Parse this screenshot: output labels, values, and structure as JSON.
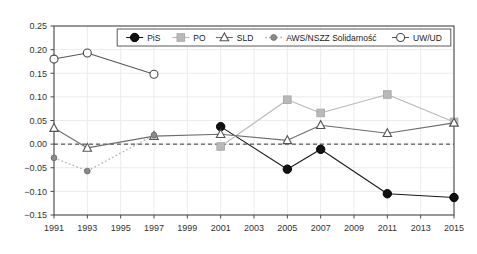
{
  "chart_data": {
    "type": "line",
    "title": "",
    "subtitle": "",
    "xlabel": "",
    "ylabel": "",
    "x": [
      1991,
      1993,
      1995,
      1997,
      1999,
      2001,
      2003,
      2005,
      2007,
      2009,
      2011,
      2013,
      2015
    ],
    "xtick_labels": [
      "1991",
      "1993",
      "1995",
      "1997",
      "1999",
      "2001",
      "2003",
      "2005",
      "2007",
      "2009",
      "2011",
      "2013",
      "2015"
    ],
    "xlim": [
      1991,
      2015
    ],
    "ylim": [
      -0.15,
      0.25
    ],
    "ytick_labels": [
      "0.25",
      "0.20",
      "0.15",
      "0.10",
      "0.05",
      "0.00",
      "-0.05",
      "-0.10",
      "-0.15"
    ],
    "ytick_values": [
      0.25,
      0.2,
      0.15,
      0.1,
      0.05,
      0.0,
      -0.05,
      -0.1,
      -0.15
    ],
    "grid": true,
    "zero_line": 0.0,
    "legend_position": "top-center",
    "series": [
      {
        "name": "PiS",
        "marker": "filled-circle",
        "color": "#1a1a1a",
        "line_style": "solid",
        "points": [
          {
            "x": 2001,
            "y": 0.037
          },
          {
            "x": 2005,
            "y": -0.053
          },
          {
            "x": 2007,
            "y": -0.011
          },
          {
            "x": 2011,
            "y": -0.105
          },
          {
            "x": 2015,
            "y": -0.113
          }
        ]
      },
      {
        "name": "PO",
        "marker": "filled-square",
        "color": "#b9b9b9",
        "line_style": "solid",
        "points": [
          {
            "x": 2001,
            "y": -0.005
          },
          {
            "x": 2005,
            "y": 0.094
          },
          {
            "x": 2007,
            "y": 0.066
          },
          {
            "x": 2011,
            "y": 0.105
          },
          {
            "x": 2015,
            "y": 0.047
          }
        ]
      },
      {
        "name": "SLD",
        "marker": "open-triangle",
        "color": "#6e6e6e",
        "line_style": "solid",
        "points": [
          {
            "x": 1991,
            "y": 0.034
          },
          {
            "x": 1993,
            "y": -0.008
          },
          {
            "x": 1997,
            "y": 0.017
          },
          {
            "x": 2001,
            "y": 0.021
          },
          {
            "x": 2005,
            "y": 0.008
          },
          {
            "x": 2007,
            "y": 0.04
          },
          {
            "x": 2011,
            "y": 0.023
          },
          {
            "x": 2015,
            "y": 0.045
          }
        ]
      },
      {
        "name": "AWS/NSZZ Solidarność",
        "marker": "small-filled-circle",
        "color": "#8a8a8a",
        "line_style": "dotted",
        "points": [
          {
            "x": 1991,
            "y": -0.029
          },
          {
            "x": 1993,
            "y": -0.057
          },
          {
            "x": 1997,
            "y": 0.019
          }
        ]
      },
      {
        "name": "UW/UD",
        "marker": "open-circle",
        "color": "#585858",
        "line_style": "solid",
        "points": [
          {
            "x": 1991,
            "y": 0.18
          },
          {
            "x": 1993,
            "y": 0.193
          },
          {
            "x": 1997,
            "y": 0.148
          }
        ]
      }
    ]
  },
  "legend": {
    "entries": [
      {
        "label": "PiS"
      },
      {
        "label": "PO"
      },
      {
        "label": "SLD"
      },
      {
        "label": "AWS/NSZZ Solidarność"
      },
      {
        "label": "UW/UD"
      }
    ]
  },
  "colors": {
    "frame": "#4a4a4a",
    "grid": "#ebebeb",
    "zero_line": "#333333",
    "background": "#ffffff",
    "tick_text": "#333333"
  }
}
